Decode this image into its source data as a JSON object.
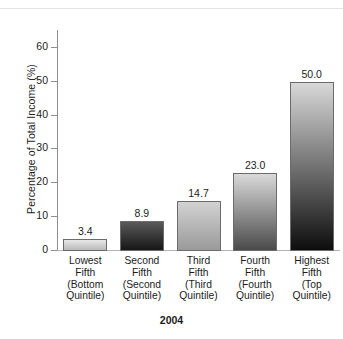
{
  "chart_data": {
    "type": "bar",
    "title": "",
    "subtitle": "",
    "xlabel": "2004",
    "ylabel": "Percentage of Total Income (%)",
    "ylim": [
      0,
      65
    ],
    "y_ticks": [
      0,
      10,
      20,
      30,
      40,
      50,
      60
    ],
    "grid": false,
    "legend": null,
    "categories": [
      "Lowest Fifth (Bottom Quintile)",
      "Second Fifth (Second Quintile)",
      "Third Fifth (Third Quintile)",
      "Fourth Fifth (Fourth Quintile)",
      "Highest Fifth (Top Quintile)"
    ],
    "category_lines": [
      [
        "Lowest",
        "Fifth",
        "(Bottom",
        "Quintile)"
      ],
      [
        "Second",
        "Fifth",
        "(Second",
        "Quintile)"
      ],
      [
        "Third",
        "Fifth",
        "(Third",
        "Quintile)"
      ],
      [
        "Fourth",
        "Fifth",
        "(Fourth",
        "Quintile)"
      ],
      [
        "Highest",
        "Fifth",
        "(Top",
        "Quintile)"
      ]
    ],
    "values": [
      3.4,
      8.9,
      14.7,
      23.0,
      50.0
    ],
    "value_labels": [
      "3.4",
      "8.9",
      "14.7",
      "23.0",
      "50.0"
    ],
    "bar_colors": [
      {
        "top": "#e8e8e8",
        "bottom": "#b9b9b9"
      },
      {
        "top": "#5a5a5a",
        "bottom": "#161616"
      },
      {
        "top": "#d2d2d2",
        "bottom": "#9a9a9a"
      },
      {
        "top": "#d9d9d9",
        "bottom": "#4a4a4a"
      },
      {
        "top": "#d8d8d8",
        "bottom": "#0d0d0d"
      }
    ],
    "axis_color": "#8f8f8f",
    "text_color": "#1c1c1c"
  },
  "axis": {
    "y_tick_labels": [
      "0",
      "10",
      "20",
      "30",
      "40",
      "50",
      "60"
    ],
    "y_title": "Percentage of Total Income (%)",
    "x_title": "2004"
  }
}
